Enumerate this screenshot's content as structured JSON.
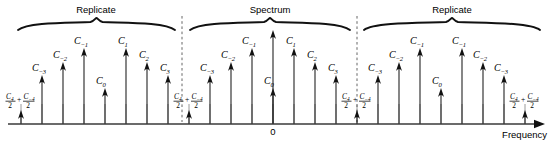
{
  "figure": {
    "axis": {
      "label": "Frequency",
      "origin_label": "0",
      "baseline_y": 124,
      "x_start": 8,
      "x_end": 545
    },
    "braces": [
      {
        "label": "Replicate",
        "x_start": 18,
        "x_end": 175,
        "label_x": 96,
        "label_y": 13
      },
      {
        "label": "Spectrum",
        "x_start": 190,
        "x_end": 350,
        "label_x": 270,
        "label_y": 13
      },
      {
        "label": "Replicate",
        "x_start": 364,
        "x_end": 540,
        "label_x": 452,
        "label_y": 13
      }
    ],
    "dividers": [
      {
        "x": 182,
        "y_top": 16,
        "y_bottom": 122
      },
      {
        "x": 357,
        "y_top": 16,
        "y_bottom": 122
      }
    ],
    "colors": {
      "ink": "#111111",
      "axis": "#3a3a3a",
      "stem": "#1a1a1a",
      "divider": "#555555",
      "background": "#ffffff"
    },
    "grid_tick_spacing": 21.6,
    "grid_tick_top": 104,
    "lines": [
      {
        "x": 21,
        "top": 110,
        "label_kind": "fraction",
        "label": "C4/2 + C-4/2",
        "num_a": "C",
        "sub_a": "4",
        "num_b": "C",
        "sub_b": "−4",
        "den": "2",
        "label_x": 6,
        "label_y": 99
      },
      {
        "x": 42,
        "top": 75,
        "label_kind": "coef",
        "label": "C−3",
        "base": "C",
        "sub": "−3",
        "label_x": 32,
        "label_y": 71
      },
      {
        "x": 63,
        "top": 62,
        "label_kind": "coef",
        "label": "C−2",
        "base": "C",
        "sub": "−2",
        "label_x": 53,
        "label_y": 58
      },
      {
        "x": 84,
        "top": 48,
        "label_kind": "coef",
        "label": "C−1",
        "base": "C",
        "sub": "−1",
        "label_x": 74,
        "label_y": 44
      },
      {
        "x": 105,
        "top": 88,
        "label_kind": "coef",
        "label": "C0",
        "base": "C",
        "sub": "0",
        "label_x": 96,
        "label_y": 84
      },
      {
        "x": 126,
        "top": 48,
        "label_kind": "coef",
        "label": "C1",
        "base": "C",
        "sub": "1",
        "label_x": 118,
        "label_y": 44
      },
      {
        "x": 147,
        "top": 62,
        "label_kind": "coef",
        "label": "C2",
        "base": "C",
        "sub": "2",
        "label_x": 139,
        "label_y": 58
      },
      {
        "x": 168,
        "top": 75,
        "label_kind": "coef",
        "label": "C3",
        "base": "C",
        "sub": "3",
        "label_x": 160,
        "label_y": 71
      },
      {
        "x": 189,
        "top": 110,
        "label_kind": "fraction",
        "label": "C4/2 + C-4/2",
        "num_a": "C",
        "sub_a": "4",
        "num_b": "C",
        "sub_b": "−4",
        "den": "2",
        "label_x": 174,
        "label_y": 99
      },
      {
        "x": 210,
        "top": 75,
        "label_kind": "coef",
        "label": "C−3",
        "base": "C",
        "sub": "−3",
        "label_x": 200,
        "label_y": 71
      },
      {
        "x": 231,
        "top": 62,
        "label_kind": "coef",
        "label": "C−2",
        "base": "C",
        "sub": "−2",
        "label_x": 221,
        "label_y": 58
      },
      {
        "x": 252,
        "top": 48,
        "label_kind": "coef",
        "label": "C−1",
        "base": "C",
        "sub": "−1",
        "label_x": 242,
        "label_y": 44
      },
      {
        "x": 273,
        "top": 88,
        "label_kind": "coef",
        "label": "C0",
        "base": "C",
        "sub": "0",
        "label_x": 264,
        "label_y": 84
      },
      {
        "x": 273,
        "top": 30,
        "label_kind": "none",
        "label": "",
        "tall": true
      },
      {
        "x": 294,
        "top": 48,
        "label_kind": "coef",
        "label": "C1",
        "base": "C",
        "sub": "1",
        "label_x": 286,
        "label_y": 44
      },
      {
        "x": 315,
        "top": 62,
        "label_kind": "coef",
        "label": "C2",
        "base": "C",
        "sub": "2",
        "label_x": 307,
        "label_y": 58
      },
      {
        "x": 336,
        "top": 75,
        "label_kind": "coef",
        "label": "C3",
        "base": "C",
        "sub": "3",
        "label_x": 328,
        "label_y": 71
      },
      {
        "x": 357,
        "top": 110,
        "label_kind": "fraction",
        "label": "C4/2 + C-4/2",
        "num_a": "C",
        "sub_a": "4",
        "num_b": "C",
        "sub_b": "−4",
        "den": "2",
        "label_x": 342,
        "label_y": 99
      },
      {
        "x": 378,
        "top": 75,
        "label_kind": "coef",
        "label": "C−3",
        "base": "C",
        "sub": "−3",
        "label_x": 368,
        "label_y": 71
      },
      {
        "x": 399,
        "top": 62,
        "label_kind": "coef",
        "label": "C−2",
        "base": "C",
        "sub": "−2",
        "label_x": 389,
        "label_y": 58
      },
      {
        "x": 420,
        "top": 48,
        "label_kind": "coef",
        "label": "C−1",
        "base": "C",
        "sub": "−1",
        "label_x": 410,
        "label_y": 44
      },
      {
        "x": 441,
        "top": 88,
        "label_kind": "coef",
        "label": "C0",
        "base": "C",
        "sub": "0",
        "label_x": 432,
        "label_y": 84
      },
      {
        "x": 462,
        "top": 48,
        "label_kind": "coef",
        "label": "C−1",
        "base": "C",
        "sub": "−1",
        "label_x": 452,
        "label_y": 44
      },
      {
        "x": 483,
        "top": 62,
        "label_kind": "coef",
        "label": "C−2",
        "base": "C",
        "sub": "−2",
        "label_x": 473,
        "label_y": 58
      },
      {
        "x": 504,
        "top": 75,
        "label_kind": "coef",
        "label": "C−3",
        "base": "C",
        "sub": "−3",
        "label_x": 494,
        "label_y": 71
      },
      {
        "x": 525,
        "top": 110,
        "label_kind": "fraction",
        "label": "C4/2 + C-4/2",
        "num_a": "C",
        "sub_a": "4",
        "num_b": "C",
        "sub_b": "−4",
        "den": "2",
        "label_x": 510,
        "label_y": 99
      }
    ]
  }
}
